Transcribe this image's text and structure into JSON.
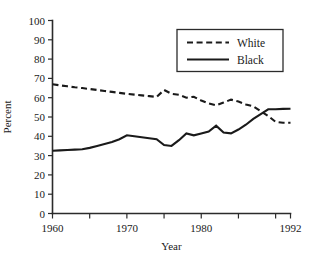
{
  "chart_data": {
    "type": "line",
    "title": "",
    "xlabel": "Year",
    "ylabel": "Percent",
    "xlim": [
      1960,
      1992
    ],
    "ylim": [
      0,
      100
    ],
    "grid": false,
    "legend_position": "top-right",
    "y_ticks": [
      0,
      10,
      20,
      30,
      40,
      50,
      60,
      70,
      80,
      90,
      100
    ],
    "y_tick_labels": [
      "0",
      "10",
      "20",
      "30",
      "40",
      "50",
      "60",
      "70",
      "80",
      "90",
      "100"
    ],
    "x_ticks": [
      1960,
      1965,
      1970,
      1975,
      1980,
      1985,
      1990,
      1992
    ],
    "x_tick_labels": [
      "1960",
      "",
      "1970",
      "",
      "1980",
      "",
      "",
      "1992"
    ],
    "x": [
      1960,
      1961,
      1962,
      1963,
      1964,
      1965,
      1966,
      1967,
      1968,
      1969,
      1970,
      1971,
      1972,
      1973,
      1974,
      1975,
      1976,
      1977,
      1978,
      1979,
      1980,
      1981,
      1982,
      1983,
      1984,
      1985,
      1986,
      1987,
      1988,
      1989,
      1990,
      1991,
      1992
    ],
    "series": [
      {
        "name": "White",
        "style": "dashed",
        "color": "#1a1a1a",
        "values": [
          67,
          66.4,
          65.9,
          65.4,
          65,
          64.5,
          64,
          63.5,
          63,
          62.5,
          62,
          61.6,
          61.2,
          60.8,
          60.4,
          64,
          62,
          61.5,
          60,
          60.5,
          58.5,
          57,
          56,
          57.5,
          59,
          58,
          56.5,
          55.5,
          53,
          50.5,
          47.5,
          47,
          47
        ]
      },
      {
        "name": "Black",
        "style": "solid",
        "color": "#1a1a1a",
        "values": [
          32.5,
          32.7,
          32.9,
          33.1,
          33.3,
          34,
          35,
          36,
          37,
          38.5,
          40.5,
          40,
          39.5,
          39,
          38.5,
          35.5,
          35,
          38,
          41.5,
          40.5,
          41.5,
          42.5,
          45.5,
          42,
          41.5,
          43.5,
          46,
          49,
          51.5,
          54,
          54,
          54.2,
          54.3
        ]
      }
    ]
  },
  "legend": {
    "entries": [
      {
        "label": "White",
        "style": "dashed"
      },
      {
        "label": "Black",
        "style": "solid"
      }
    ]
  },
  "axes": {
    "y_title": "Percent",
    "x_title": "Year"
  }
}
